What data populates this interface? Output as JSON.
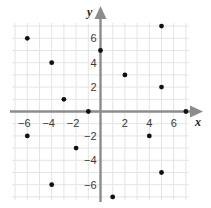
{
  "chart_data": {
    "type": "scatter",
    "title": "",
    "xlabel": "x",
    "ylabel": "y",
    "xlim": [
      -7,
      7
    ],
    "ylim": [
      -7,
      7
    ],
    "grid": true,
    "x_ticks": [
      -6,
      -4,
      -2,
      2,
      4,
      6
    ],
    "y_ticks": [
      6,
      4,
      2,
      -2,
      -4,
      -6
    ],
    "x_tick_labels": [
      "−6",
      "−4",
      "−2",
      "2",
      "4",
      "6"
    ],
    "y_tick_labels": [
      "6",
      "4",
      "2",
      "−2",
      "−4",
      "−6"
    ],
    "points": [
      {
        "x": -6,
        "y": 6
      },
      {
        "x": -4,
        "y": 4
      },
      {
        "x": -3,
        "y": 1
      },
      {
        "x": -1,
        "y": 0
      },
      {
        "x": 0,
        "y": 5
      },
      {
        "x": 2,
        "y": 3
      },
      {
        "x": 5,
        "y": 7
      },
      {
        "x": 5,
        "y": 2
      },
      {
        "x": 7,
        "y": 0
      },
      {
        "x": -6,
        "y": -2
      },
      {
        "x": -2,
        "y": -3
      },
      {
        "x": -4,
        "y": -6
      },
      {
        "x": 4,
        "y": -2
      },
      {
        "x": 5,
        "y": -5
      },
      {
        "x": 1,
        "y": -7
      }
    ]
  },
  "colors": {
    "axis": "#8c8c8c",
    "grid": "#e4e4e4",
    "point": "#111111",
    "tick_label": "#3a3a3a"
  }
}
